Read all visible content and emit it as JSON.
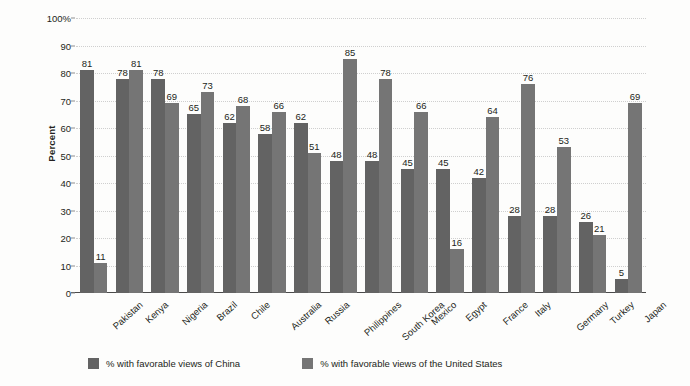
{
  "chart_data": {
    "type": "bar",
    "title": "",
    "subtitle": "",
    "xlabel": "",
    "ylabel": "Percent",
    "ylim": [
      0,
      100
    ],
    "grid": true,
    "legend_position": "bottom",
    "ytick_labels": [
      "0",
      "10",
      "20",
      "30",
      "40",
      "50",
      "60",
      "70",
      "80",
      "90",
      "100%"
    ],
    "ytick_values": [
      0,
      10,
      20,
      30,
      40,
      50,
      60,
      70,
      80,
      90,
      100
    ],
    "categories": [
      "Pakistan",
      "Kenya",
      "Nigeria",
      "Brazil",
      "Chile",
      "Australia",
      "Russia",
      "Philippines",
      "South Korea",
      "Mexico",
      "Egypt",
      "France",
      "Italy",
      "Germany",
      "Turkey",
      "Japan"
    ],
    "series": [
      {
        "name": "% with favorable views of China",
        "color": "#636363",
        "values": [
          81,
          78,
          78,
          65,
          62,
          58,
          62,
          48,
          48,
          45,
          45,
          42,
          28,
          28,
          26,
          5
        ]
      },
      {
        "name": "% with favorable views of the United States",
        "color": "#757575",
        "values": [
          11,
          81,
          69,
          73,
          68,
          66,
          51,
          85,
          78,
          66,
          16,
          64,
          76,
          53,
          21,
          69
        ]
      }
    ]
  },
  "legend": {
    "items": [
      {
        "label": "% with favorable views of China",
        "swatch": "legend-swatch-china"
      },
      {
        "label": "% with favorable views of the United States",
        "swatch": "legend-swatch-united-states"
      }
    ]
  },
  "axes": {
    "y_title": "Percent"
  }
}
